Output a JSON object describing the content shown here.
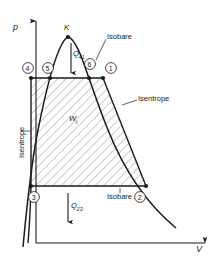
{
  "diagram": {
    "type": "p-V diagram, Clausius-Rankine steam power cycle",
    "axes": {
      "y_label": "p",
      "x_label": "V"
    },
    "critical_point": {
      "label": "K",
      "x": 68,
      "y": 37
    },
    "state_points": [
      {
        "label": "1",
        "x": 103,
        "y": 78,
        "label_x": 108,
        "label_y": 65
      },
      {
        "label": "2",
        "x": 146,
        "y": 186,
        "label_x": 140,
        "label_y": 192
      },
      {
        "label": "3",
        "x": 31,
        "y": 186,
        "label_x": 30,
        "label_y": 192
      },
      {
        "label": "4",
        "x": 31,
        "y": 78,
        "label_x": 25,
        "label_y": 65
      },
      {
        "label": "5",
        "x": 50,
        "y": 78,
        "label_x": 45,
        "label_y": 65
      },
      {
        "label": "6",
        "x": 89,
        "y": 78,
        "label_x": 87,
        "label_y": 62
      }
    ],
    "annotations": {
      "isobare_top": "Isobare",
      "isobare_bottom": "Isobare",
      "isentrope_right": "Isentrope",
      "isentrope_left": "Isentrope",
      "heat_in": "Q",
      "heat_in_sub": "41",
      "heat_out": "Q",
      "heat_out_sub": "23",
      "work": "W",
      "work_sub": "t"
    },
    "colors": {
      "line": "#1a1a1a",
      "hatch": "#555555",
      "background": "#ffffff"
    }
  }
}
